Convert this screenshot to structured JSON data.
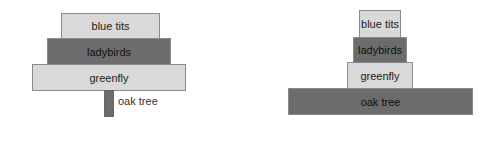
{
  "pyramid_of_numbers": {
    "title": "",
    "levels": [
      {
        "label": "blue tits",
        "shade": "light"
      },
      {
        "label": "ladybirds",
        "shade": "dark"
      },
      {
        "label": "greenfly",
        "shade": "light"
      },
      {
        "label": "oak tree",
        "shade": "dark"
      }
    ]
  },
  "pyramid_of_biomass": {
    "title": "",
    "levels": [
      {
        "label": "blue tits",
        "shade": "light"
      },
      {
        "label": "ladybirds",
        "shade": "dark"
      },
      {
        "label": "greenfly",
        "shade": "light"
      },
      {
        "label": "oak tree",
        "shade": "dark"
      }
    ]
  },
  "colors": {
    "light": "#d9d9d9",
    "dark": "#6c6c6c"
  }
}
